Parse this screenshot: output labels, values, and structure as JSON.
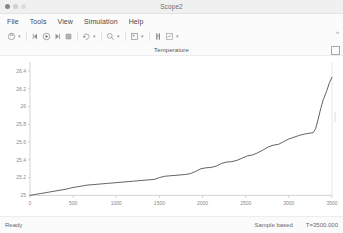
{
  "window": {
    "title": "Scope2",
    "controls": [
      "close",
      "minimize",
      "maximize"
    ]
  },
  "menubar": {
    "items": [
      {
        "label": "File"
      },
      {
        "label": "Tools"
      },
      {
        "label": "View"
      },
      {
        "label": "Simulation"
      },
      {
        "label": "Help"
      }
    ]
  },
  "toolbar": {
    "buttons": [
      {
        "name": "print-icon",
        "has_caret": true
      },
      {
        "name": "step-back-icon",
        "has_caret": false
      },
      {
        "name": "run-icon",
        "has_caret": false
      },
      {
        "name": "step-forward-icon",
        "has_caret": false
      },
      {
        "name": "stop-icon",
        "has_caret": false
      },
      {
        "name": "restore-view-icon",
        "has_caret": true
      },
      {
        "name": "zoom-icon",
        "has_caret": true
      },
      {
        "name": "layout-icon",
        "has_caret": true
      },
      {
        "name": "cursor-measurement-icon",
        "has_caret": false
      },
      {
        "name": "signal-selection-icon",
        "has_caret": true
      }
    ],
    "overflow_label": "»"
  },
  "plot": {
    "title": "Temperature",
    "corner_icon": "maximize-axes-icon"
  },
  "statusbar": {
    "ready_label": "Ready",
    "sample_mode": "Sample based",
    "time_label": "T=3500.000"
  },
  "chart_data": {
    "type": "line",
    "title": "Temperature",
    "xlabel": "",
    "ylabel": "",
    "xlim": [
      0,
      3500
    ],
    "ylim": [
      25,
      26.5
    ],
    "grid": false,
    "legend": false,
    "line_color": "#4a4a4a",
    "xticks": [
      0,
      500,
      1000,
      1500,
      2000,
      2500,
      3000,
      3500
    ],
    "xtick_labels": [
      "0",
      "500",
      "1000",
      "1500",
      "2000",
      "2500",
      "3000",
      "3500"
    ],
    "yticks": [
      25,
      25.2,
      25.4,
      25.6,
      25.8,
      26,
      26.2,
      26.4
    ],
    "ytick_labels": [
      "25",
      "25.2",
      "25.4",
      "25.6",
      "25.8",
      "26",
      "26.2",
      "26.4"
    ],
    "series": [
      {
        "name": "Temperature",
        "x": [
          0,
          60,
          120,
          180,
          240,
          300,
          360,
          420,
          480,
          540,
          600,
          660,
          720,
          780,
          840,
          900,
          960,
          1020,
          1080,
          1140,
          1200,
          1260,
          1320,
          1380,
          1440,
          1500,
          1560,
          1620,
          1680,
          1740,
          1800,
          1860,
          1920,
          1980,
          2040,
          2100,
          2160,
          2220,
          2280,
          2340,
          2400,
          2460,
          2520,
          2580,
          2640,
          2700,
          2760,
          2820,
          2880,
          2940,
          3000,
          3060,
          3120,
          3180,
          3240,
          3280,
          3310,
          3340,
          3370,
          3400,
          3440,
          3470,
          3500
        ],
        "y": [
          25.0,
          25.01,
          25.02,
          25.03,
          25.04,
          25.05,
          25.06,
          25.07,
          25.085,
          25.095,
          25.105,
          25.115,
          25.12,
          25.125,
          25.13,
          25.135,
          25.14,
          25.145,
          25.15,
          25.155,
          25.16,
          25.165,
          25.17,
          25.175,
          25.18,
          25.2,
          25.215,
          25.22,
          25.225,
          25.23,
          25.235,
          25.245,
          25.27,
          25.3,
          25.31,
          25.315,
          25.33,
          25.36,
          25.375,
          25.38,
          25.395,
          25.42,
          25.445,
          25.455,
          25.48,
          25.51,
          25.545,
          25.565,
          25.575,
          25.605,
          25.635,
          25.655,
          25.675,
          25.69,
          25.7,
          25.705,
          25.75,
          25.86,
          25.98,
          26.08,
          26.18,
          26.27,
          26.33
        ]
      }
    ]
  }
}
